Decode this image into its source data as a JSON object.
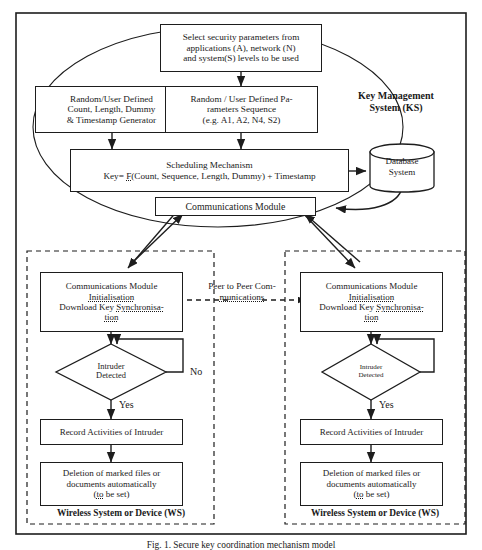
{
  "figure": {
    "caption": "Fig. 1. Secure key coordination mechanism model"
  },
  "key_management_system": {
    "label": "Key Management\nSystem (KS)",
    "label_line1": "Key Management",
    "label_line2": "System (KS)",
    "select_params": {
      "line1": "Select security parameters  from",
      "line2": "applications  (A), network (N)",
      "line3": "and system(S) levels to be used"
    },
    "random_count_generator": {
      "line1": "Random/User Defined",
      "line2": "Count, Length, Dummy",
      "line3": "& Timestamp  Generator"
    },
    "random_parameters_sequence": {
      "line1": "Random / User Defined Pa-",
      "line2": "rameters  Sequence",
      "line3": "(e.g. A1, A2, N4, S2)"
    },
    "scheduling_mechanism": {
      "line1": "Scheduling Mechanism",
      "line2_prefix": "Key= ",
      "line2_fn": "F",
      "line2_rest": "(Count, Sequence, Length, Dummy) + Timestamp"
    },
    "database_system": {
      "line1": "Database",
      "line2": "System"
    },
    "communications_module": {
      "label": "Communications Module"
    }
  },
  "peer_link": {
    "line1": "Peer to Peer Com-",
    "line2": "munications"
  },
  "wireless_systems": [
    {
      "id": "left",
      "caption": "Wireless System or Device (WS)",
      "comm_init": {
        "line1": "Communications  Module",
        "line2": "Initialisation",
        "line3_prefix": "Download Key ",
        "line3_word": "Synchronisa-",
        "line4_word": "tion"
      },
      "decision": {
        "line1": "Intruder",
        "line2": "Detected"
      },
      "branch_no": "No",
      "branch_yes": "Yes",
      "record": "Record Activities of Intruder",
      "deletion": {
        "line1": "Deletion of marked files  or",
        "line2": "documents  automatically",
        "line3_open": "(",
        "line3_word": "to",
        "line3_rest": " be set)"
      }
    },
    {
      "id": "right",
      "caption": "Wireless System or Device (WS)",
      "comm_init": {
        "line1": "Communications  Module",
        "line2": "Initialisation",
        "line3_prefix": "Download Key ",
        "line3_word": "Synchronisa-",
        "line4_word": "tion"
      },
      "decision": {
        "line1": "Intruder",
        "line2": "Detected"
      },
      "branch_no": "",
      "branch_yes": "Yes",
      "record": "Record Activities of Intruder",
      "deletion": {
        "line1": "Deletion of marked files  or",
        "line2": "documents  automatically",
        "line3_open": "(",
        "line3_word": "to",
        "line3_rest": " be set)"
      }
    }
  ],
  "colors": {
    "stroke": "#1d1d1d",
    "background": "#ffffff",
    "text": "#1a1a1a"
  }
}
